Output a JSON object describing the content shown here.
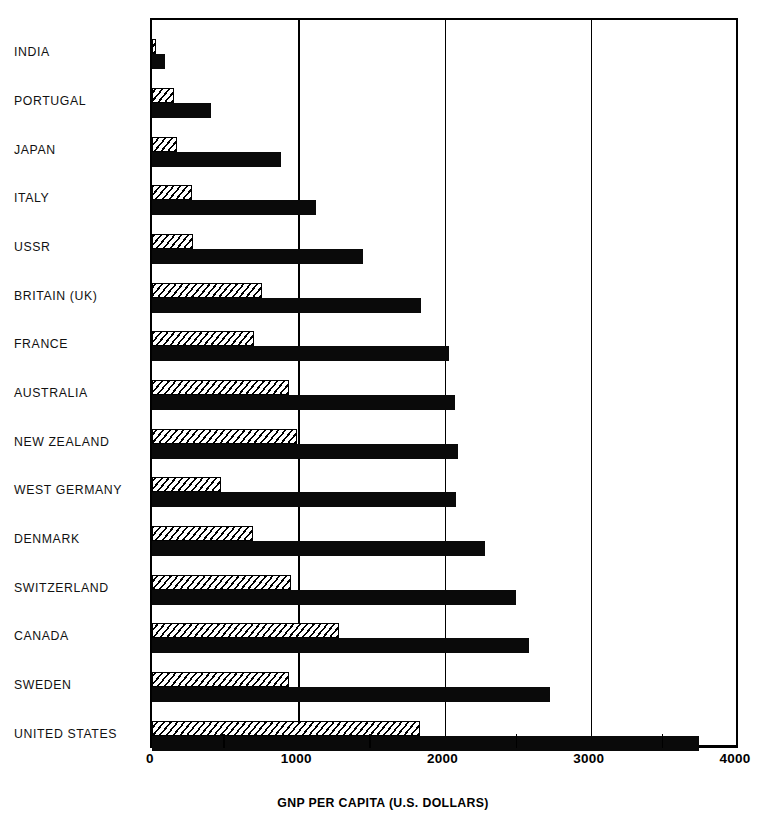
{
  "chart_data": {
    "type": "bar",
    "orientation": "horizontal",
    "title": "",
    "xlabel": "GNP PER CAPITA (U.S. DOLLARS)",
    "ylabel": "",
    "xlim": [
      0,
      4000
    ],
    "xticks": [
      0,
      1000,
      2000,
      3000,
      4000
    ],
    "xtick_labels": [
      "0",
      "1000",
      "2000",
      "3000",
      "4000"
    ],
    "minor_ticks": [
      500,
      1500,
      2500,
      3500
    ],
    "grid": true,
    "grid_axis": "x",
    "legend": null,
    "categories": [
      "INDIA",
      "PORTUGAL",
      "JAPAN",
      "ITALY",
      "USSR",
      "BRITAIN  (UK)",
      "FRANCE",
      "AUSTRALIA",
      "NEW ZEALAND",
      "WEST GERMANY",
      "DENMARK",
      "SWITZERLAND",
      "CANADA",
      "SWEDEN",
      "UNITED STATES"
    ],
    "series": [
      {
        "name": "hatched-series",
        "style": "hatched",
        "values": [
          20,
          150,
          170,
          275,
          280,
          750,
          700,
          940,
          990,
          470,
          690,
          950,
          1280,
          940,
          1830
        ]
      },
      {
        "name": "solid-series",
        "style": "solid",
        "values": [
          90,
          400,
          880,
          1120,
          1440,
          1840,
          2030,
          2070,
          2090,
          2080,
          2280,
          2490,
          2580,
          2720,
          3740
        ]
      }
    ]
  },
  "axis": {
    "x_title": "GNP PER CAPITA (U.S. DOLLARS)",
    "tick_0": "0",
    "tick_1000": "1000",
    "tick_2000": "2000",
    "tick_3000": "3000",
    "tick_4000": "4000"
  }
}
